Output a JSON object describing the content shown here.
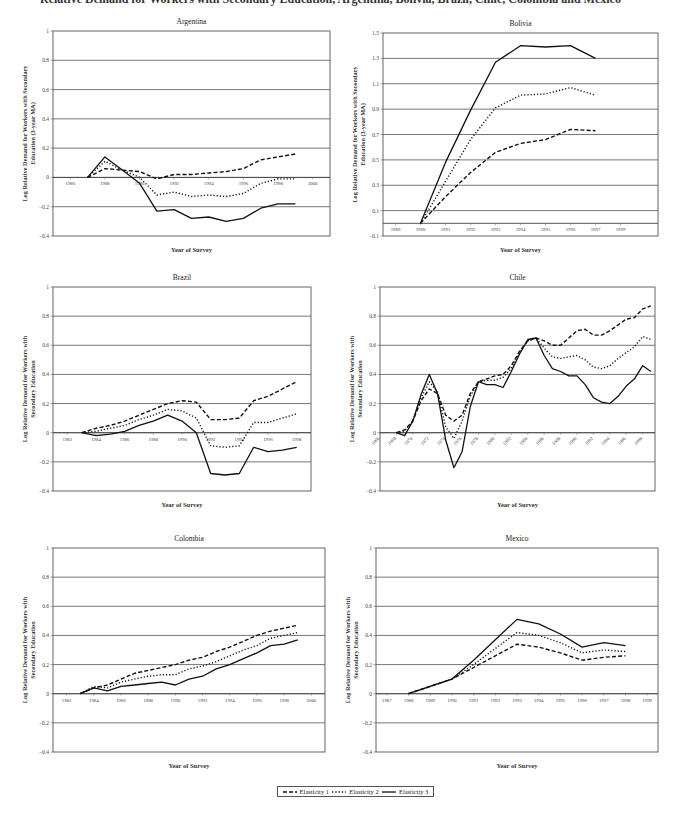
{
  "page": {
    "title": "Relative Demand for Workers with Secondary Education, Argentina, Bolivia, Brazil, Chile, Colombia and Mexico"
  },
  "legend": {
    "items": [
      {
        "label": "Elasticity 1",
        "style": "dashed"
      },
      {
        "label": "Elasticity 2",
        "style": "dotted"
      },
      {
        "label": "Elasticity 3",
        "style": "solid"
      }
    ]
  },
  "chart_data": [
    {
      "type": "line",
      "title": "Argentina",
      "xlabel": "Year of Survey",
      "ylabel": "Log Relative Demand for Workers with Secondary Education (3-year MA)",
      "ylim": [
        -0.4,
        1
      ],
      "yticks": [
        -0.4,
        -0.2,
        0,
        0.2,
        0.4,
        0.6,
        0.8,
        1
      ],
      "ytick_labels": [
        "-0.4",
        "-0.2",
        "0",
        "0.2",
        "0.4",
        "0.6",
        "0.8",
        "1"
      ],
      "xlim": [
        1985,
        2001
      ],
      "xticks": [
        1986,
        1988,
        1990,
        1992,
        1994,
        1996,
        1998,
        2000
      ],
      "grid": true,
      "x": [
        1987,
        1988,
        1989,
        1990,
        1991,
        1992,
        1993,
        1994,
        1995,
        1996,
        1997,
        1998,
        1999
      ],
      "series": [
        {
          "name": "Elasticity 1",
          "values": [
            0,
            0.06,
            0.05,
            0.04,
            -0.01,
            0.02,
            0.02,
            0.03,
            0.04,
            0.06,
            0.12,
            0.14,
            0.16
          ]
        },
        {
          "name": "Elasticity 2",
          "values": [
            0,
            0.11,
            0.05,
            0.0,
            -0.12,
            -0.1,
            -0.13,
            -0.12,
            -0.13,
            -0.11,
            -0.04,
            -0.01,
            -0.01
          ]
        },
        {
          "name": "Elasticity 3",
          "values": [
            0,
            0.14,
            0.05,
            -0.04,
            -0.23,
            -0.22,
            -0.28,
            -0.27,
            -0.3,
            -0.28,
            -0.21,
            -0.18,
            -0.18
          ]
        }
      ]
    },
    {
      "type": "line",
      "title": "Bolivia",
      "xlabel": "Year of Survey",
      "ylabel": "Log Relative Demand for Workers with Secondary Education (3-year MA)",
      "ylim": [
        -0.1,
        1.5
      ],
      "yticks": [
        -0.1,
        0.1,
        0.3,
        0.5,
        0.7,
        0.9,
        1.1,
        1.3,
        1.5
      ],
      "ytick_labels": [
        "-0.1",
        "0.1",
        "0.3",
        "0.5",
        "0.7",
        "0.9",
        "1.1",
        "1.3",
        "1.5"
      ],
      "xlim": [
        1988.5,
        1999.5
      ],
      "xticks": [
        1989,
        1990,
        1991,
        1992,
        1993,
        1994,
        1995,
        1996,
        1997,
        1998
      ],
      "xtick_labels": [
        "1989",
        "1990",
        "1991",
        "1992",
        "1993",
        "1994",
        "1995",
        "1996",
        "1997",
        "1999"
      ],
      "grid": true,
      "x": [
        1990,
        1991,
        1992,
        1993,
        1994,
        1995,
        1996,
        1997
      ],
      "series": [
        {
          "name": "Elasticity 1",
          "values": [
            0,
            0.21,
            0.4,
            0.56,
            0.63,
            0.66,
            0.74,
            0.73
          ]
        },
        {
          "name": "Elasticity 2",
          "values": [
            0,
            0.33,
            0.66,
            0.91,
            1.01,
            1.02,
            1.07,
            1.01
          ]
        },
        {
          "name": "Elasticity 3",
          "values": [
            0,
            0.48,
            0.89,
            1.27,
            1.4,
            1.39,
            1.4,
            1.3
          ]
        }
      ]
    },
    {
      "type": "line",
      "title": "Brazil",
      "xlabel": "Year of Survey",
      "ylabel": "Log Relative Demand for Workers with Secondary Education",
      "ylim": [
        -0.4,
        1
      ],
      "yticks": [
        -0.4,
        -0.2,
        0,
        0.2,
        0.4,
        0.6,
        0.8,
        1
      ],
      "ytick_labels": [
        "-0.4",
        "-0.2",
        "0",
        "0.2",
        "0.4",
        "0.6",
        "0.8",
        "1"
      ],
      "xlim": [
        1981,
        1999
      ],
      "xticks": [
        1982,
        1984,
        1986,
        1988,
        1990,
        1992,
        1994,
        1996,
        1998
      ],
      "grid": true,
      "x": [
        1983,
        1984,
        1985,
        1986,
        1987,
        1988,
        1989,
        1990,
        1991,
        1992,
        1993,
        1994,
        1995,
        1996,
        1997,
        1998
      ],
      "series": [
        {
          "name": "Elasticity 1",
          "values": [
            0,
            0.03,
            0.05,
            0.08,
            0.12,
            0.16,
            0.2,
            0.22,
            0.21,
            0.09,
            0.09,
            0.1,
            0.22,
            0.25,
            0.3,
            0.35
          ]
        },
        {
          "name": "Elasticity 2",
          "values": [
            0,
            0.01,
            0.03,
            0.05,
            0.09,
            0.12,
            0.16,
            0.15,
            0.1,
            -0.09,
            -0.1,
            -0.09,
            0.07,
            0.07,
            0.1,
            0.13
          ]
        },
        {
          "name": "Elasticity 3",
          "values": [
            0,
            -0.02,
            -0.01,
            0.01,
            0.05,
            0.08,
            0.12,
            0.08,
            0.0,
            -0.28,
            -0.29,
            -0.28,
            -0.1,
            -0.13,
            -0.12,
            -0.1
          ]
        }
      ]
    },
    {
      "type": "line",
      "title": "Chile",
      "xlabel": "Year of Survey",
      "ylabel": "Log Relative Demand for Workers with Secondary Education",
      "ylim": [
        -0.4,
        1
      ],
      "yticks": [
        -0.4,
        -0.2,
        0,
        0.2,
        0.4,
        0.6,
        0.8,
        1
      ],
      "ytick_labels": [
        "-0.4",
        "-0.2",
        "0",
        "0.2",
        "0.4",
        "0.6",
        "0.8",
        "1"
      ],
      "xlim": [
        1966,
        1999.5
      ],
      "xticks": [
        1966,
        1968,
        1970,
        1972,
        1974,
        1976,
        1978,
        1980,
        1982,
        1984,
        1986,
        1988,
        1990,
        1992,
        1994,
        1996,
        1998
      ],
      "grid": true,
      "x": [
        1968,
        1969,
        1970,
        1971,
        1972,
        1973,
        1974,
        1975,
        1976,
        1977,
        1978,
        1979,
        1980,
        1981,
        1982,
        1983,
        1984,
        1985,
        1986,
        1987,
        1988,
        1989,
        1990,
        1991,
        1992,
        1993,
        1994,
        1995,
        1996,
        1997,
        1998,
        1999
      ],
      "series": [
        {
          "name": "Elasticity 1",
          "values": [
            0,
            0.02,
            0.08,
            0.22,
            0.3,
            0.27,
            0.12,
            0.08,
            0.12,
            0.27,
            0.35,
            0.37,
            0.39,
            0.4,
            0.46,
            0.56,
            0.63,
            0.65,
            0.63,
            0.6,
            0.6,
            0.65,
            0.7,
            0.71,
            0.67,
            0.67,
            0.7,
            0.74,
            0.78,
            0.79,
            0.85,
            0.87
          ]
        },
        {
          "name": "Elasticity 2",
          "values": [
            0,
            0.01,
            0.08,
            0.24,
            0.35,
            0.28,
            0.04,
            -0.04,
            0.08,
            0.25,
            0.35,
            0.36,
            0.36,
            0.38,
            0.44,
            0.55,
            0.63,
            0.65,
            0.58,
            0.52,
            0.51,
            0.52,
            0.53,
            0.5,
            0.45,
            0.44,
            0.46,
            0.51,
            0.55,
            0.59,
            0.66,
            0.64
          ]
        },
        {
          "name": "Elasticity 3",
          "values": [
            0,
            -0.02,
            0.08,
            0.26,
            0.4,
            0.27,
            -0.05,
            -0.24,
            -0.13,
            0.18,
            0.35,
            0.33,
            0.33,
            0.31,
            0.42,
            0.54,
            0.64,
            0.65,
            0.53,
            0.44,
            0.42,
            0.39,
            0.39,
            0.33,
            0.24,
            0.21,
            0.2,
            0.25,
            0.32,
            0.37,
            0.46,
            0.42
          ]
        }
      ]
    },
    {
      "type": "line",
      "title": "Colombia",
      "xlabel": "Year of Survey",
      "ylabel": "Log Relative Demand for Workers with Secondary Education",
      "ylim": [
        -0.4,
        1
      ],
      "yticks": [
        -0.4,
        -0.2,
        0,
        0.2,
        0.4,
        0.6,
        0.8,
        1
      ],
      "ytick_labels": [
        "-0.4",
        "-0.2",
        "0",
        "0.2",
        "0.4",
        "0.6",
        "0.8",
        "1"
      ],
      "xlim": [
        1981,
        2001
      ],
      "xticks": [
        1982,
        1984,
        1986,
        1988,
        1990,
        1992,
        1994,
        1996,
        1998,
        2000
      ],
      "grid": true,
      "x": [
        1983,
        1984,
        1985,
        1986,
        1987,
        1988,
        1989,
        1990,
        1991,
        1992,
        1993,
        1994,
        1995,
        1996,
        1997,
        1998,
        1999
      ],
      "series": [
        {
          "name": "Elasticity 1",
          "values": [
            0,
            0.04,
            0.06,
            0.1,
            0.14,
            0.16,
            0.18,
            0.2,
            0.23,
            0.25,
            0.29,
            0.32,
            0.36,
            0.4,
            0.43,
            0.45,
            0.47
          ]
        },
        {
          "name": "Elasticity 2",
          "values": [
            0,
            0.05,
            0.04,
            0.08,
            0.1,
            0.12,
            0.13,
            0.13,
            0.17,
            0.19,
            0.22,
            0.26,
            0.3,
            0.33,
            0.38,
            0.4,
            0.42
          ]
        },
        {
          "name": "Elasticity 3",
          "values": [
            0,
            0.04,
            0.02,
            0.05,
            0.06,
            0.07,
            0.08,
            0.06,
            0.1,
            0.12,
            0.17,
            0.2,
            0.24,
            0.28,
            0.33,
            0.34,
            0.37
          ]
        }
      ]
    },
    {
      "type": "line",
      "title": "Mexico",
      "xlabel": "Year of Survey",
      "ylabel": "Log Relative Demand for Workers with Secondary Education",
      "ylim": [
        -0.4,
        1
      ],
      "yticks": [
        -0.4,
        -0.2,
        0,
        0.2,
        0.4,
        0.6,
        0.8,
        1
      ],
      "ytick_labels": [
        "-0.4",
        "-0.2",
        "0",
        "0.2",
        "0.4",
        "0.6",
        "0.8",
        "1"
      ],
      "xlim": [
        1986.5,
        1999.5
      ],
      "xticks": [
        1987,
        1988,
        1989,
        1990,
        1991,
        1992,
        1993,
        1994,
        1995,
        1996,
        1997,
        1998,
        1999
      ],
      "grid": true,
      "x": [
        1988,
        1989,
        1990,
        1991,
        1992,
        1993,
        1994,
        1995,
        1996,
        1997,
        1998
      ],
      "series": [
        {
          "name": "Elasticity 1",
          "values": [
            0,
            0.05,
            0.1,
            0.18,
            0.26,
            0.34,
            0.32,
            0.28,
            0.23,
            0.25,
            0.26
          ]
        },
        {
          "name": "Elasticity 2",
          "values": [
            0,
            0.05,
            0.1,
            0.2,
            0.31,
            0.42,
            0.4,
            0.35,
            0.28,
            0.3,
            0.29
          ]
        },
        {
          "name": "Elasticity 3",
          "values": [
            0,
            0.05,
            0.1,
            0.23,
            0.37,
            0.51,
            0.48,
            0.41,
            0.32,
            0.35,
            0.33
          ]
        }
      ]
    }
  ]
}
